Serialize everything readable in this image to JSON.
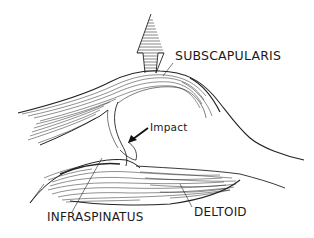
{
  "diagram": {
    "type": "anatomical-illustration",
    "labels": {
      "subscapularis": "SUBSCAPULARIS",
      "impact": "Impact",
      "infraspinatus": "INFRASPINATUS",
      "deltoid": "DELTOID"
    },
    "arrows": [
      {
        "name": "upward-force-arrow",
        "direction": "up",
        "style": "hatched"
      },
      {
        "name": "impact-arrow",
        "direction": "down-left",
        "style": "solid"
      }
    ],
    "colors": {
      "ink": "#1a1a1a",
      "background": "#ffffff"
    }
  }
}
